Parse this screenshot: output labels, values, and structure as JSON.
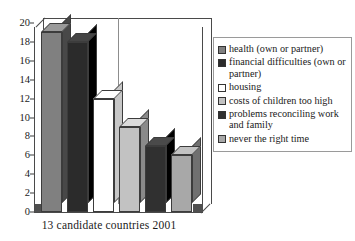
{
  "chart_data": {
    "type": "bar",
    "title": "",
    "xlabel": "13 candidate countries 2001",
    "ylabel": "",
    "ylim": [
      0,
      20
    ],
    "yticks": [
      "0",
      "2",
      "4",
      "6",
      "8",
      "10",
      "12",
      "14",
      "16",
      "18",
      "20"
    ],
    "grid": false,
    "legend_position": "right",
    "categories": [
      "health (own or partner)",
      "financial difficulties (own or partner)",
      "housing",
      "costs of children too high",
      "problems reconciling work and family",
      "never the right time"
    ],
    "values": [
      19,
      18,
      12,
      9,
      7,
      6
    ],
    "colors": [
      "#808080",
      "#2b2b2b",
      "#ffffff",
      "#c2c2c2",
      "#303030",
      "#a8a8a8"
    ]
  },
  "legend": {
    "items": [
      {
        "label": "health (own or partner)",
        "color": "#808080"
      },
      {
        "label": "financial difficulties (own or partner)",
        "color": "#2b2b2b"
      },
      {
        "label": "housing",
        "color": "#ffffff"
      },
      {
        "label": "costs of children too high",
        "color": "#c2c2c2"
      },
      {
        "label": "problems reconciling work and family",
        "color": "#303030"
      },
      {
        "label": "never the right time",
        "color": "#a8a8a8"
      }
    ]
  },
  "axis": {
    "x_label": "13 candidate countries 2001",
    "y_ticks": [
      "20",
      "18",
      "16",
      "14",
      "12",
      "10",
      "8",
      "6",
      "4",
      "2",
      "0"
    ]
  }
}
